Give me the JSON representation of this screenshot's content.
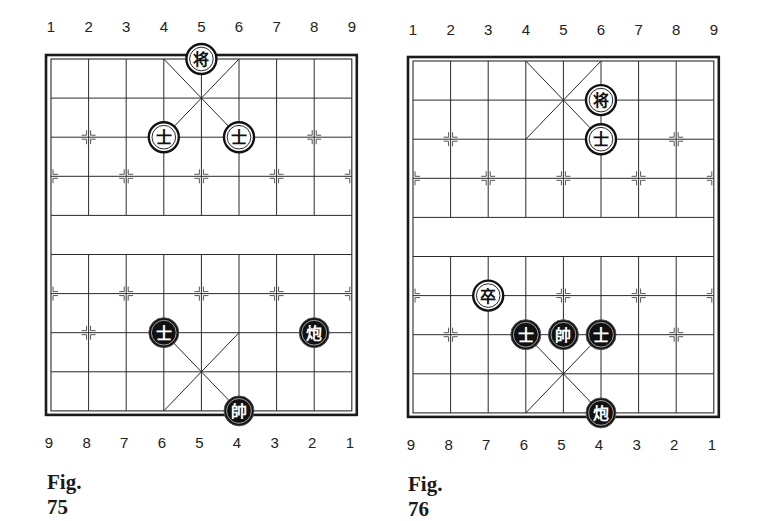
{
  "figures": [
    {
      "id": "fig75",
      "caption": "Fig. 75",
      "top_labels": [
        "1",
        "2",
        "3",
        "4",
        "5",
        "6",
        "7",
        "8",
        "9"
      ],
      "bottom_labels": [
        "9",
        "8",
        "7",
        "6",
        "5",
        "4",
        "3",
        "2",
        "1"
      ],
      "geometry": {
        "x0": 51,
        "y0": 59,
        "dx": 37.6,
        "dy": 39.1,
        "label_top_y": 19,
        "label_bottom_y": 435,
        "caption_x": 47,
        "caption_y": 470
      },
      "pieces": [
        {
          "char": "将",
          "side": "light",
          "name": "black-general",
          "col": 4,
          "row": 0
        },
        {
          "char": "士",
          "side": "light",
          "name": "black-advisor",
          "col": 3,
          "row": 2
        },
        {
          "char": "士",
          "side": "light",
          "name": "black-advisor",
          "col": 5,
          "row": 2
        },
        {
          "char": "士",
          "side": "dark",
          "name": "red-advisor",
          "col": 3,
          "row": 7
        },
        {
          "char": "炮",
          "side": "dark",
          "name": "red-cannon",
          "col": 7,
          "row": 7
        },
        {
          "char": "帥",
          "side": "dark",
          "name": "red-general",
          "col": 5,
          "row": 9
        }
      ]
    },
    {
      "id": "fig76",
      "caption": "Fig. 76",
      "top_labels": [
        "1",
        "2",
        "3",
        "4",
        "5",
        "6",
        "7",
        "8",
        "9"
      ],
      "bottom_labels": [
        "9",
        "8",
        "7",
        "6",
        "5",
        "4",
        "3",
        "2",
        "1"
      ],
      "geometry": {
        "x0": 413,
        "y0": 61,
        "dx": 37.6,
        "dy": 39.1,
        "label_top_y": 22,
        "label_bottom_y": 437,
        "caption_x": 408,
        "caption_y": 472
      },
      "pieces": [
        {
          "char": "将",
          "side": "light",
          "name": "black-general",
          "col": 5,
          "row": 1
        },
        {
          "char": "士",
          "side": "light",
          "name": "black-advisor",
          "col": 5,
          "row": 2
        },
        {
          "char": "卒",
          "side": "light",
          "name": "black-soldier",
          "col": 2,
          "row": 6
        },
        {
          "char": "士",
          "side": "dark",
          "name": "red-advisor",
          "col": 3,
          "row": 7
        },
        {
          "char": "帥",
          "side": "dark",
          "name": "red-general",
          "col": 4,
          "row": 7
        },
        {
          "char": "士",
          "side": "dark",
          "name": "red-advisor",
          "col": 5,
          "row": 7
        },
        {
          "char": "炮",
          "side": "dark",
          "name": "red-cannon",
          "col": 5,
          "row": 9
        }
      ]
    }
  ],
  "board": {
    "files": 9,
    "ranks": 10,
    "line_color": "#2a2a2a",
    "border_color": "#1a1a1a",
    "marker_points": [
      [
        1,
        2
      ],
      [
        7,
        2
      ],
      [
        0,
        3
      ],
      [
        2,
        3
      ],
      [
        4,
        3
      ],
      [
        6,
        3
      ],
      [
        8,
        3
      ],
      [
        0,
        6
      ],
      [
        2,
        6
      ],
      [
        4,
        6
      ],
      [
        6,
        6
      ],
      [
        8,
        6
      ],
      [
        1,
        7
      ],
      [
        7,
        7
      ]
    ],
    "piece_radius": 15,
    "light_fill": "#ffffff",
    "dark_fill": "#111111"
  }
}
